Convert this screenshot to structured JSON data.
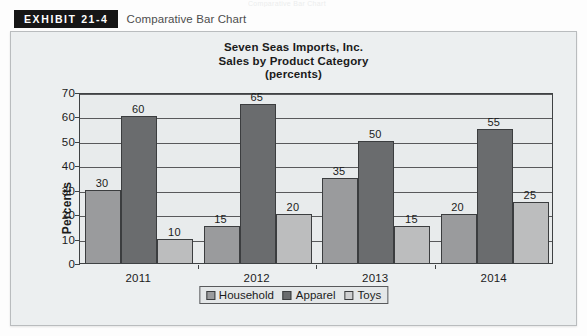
{
  "page": {
    "top_ghost_text": "Comparative Bar Chart"
  },
  "exhibit": {
    "badge": "EXHIBIT 21-4",
    "caption": "Comparative Bar Chart"
  },
  "chart_data": {
    "type": "bar",
    "title": "Seven Seas Imports, Inc.",
    "subtitle": "Sales by Product Category",
    "units_line": "(percents)",
    "title_lines": [
      "Seven Seas Imports, Inc.",
      "Sales by Product Category",
      "(percents)"
    ],
    "categories": [
      "2011",
      "2012",
      "2013",
      "2014"
    ],
    "series": [
      {
        "name": "Household",
        "color": "#9a9b9d",
        "values": [
          30,
          15,
          35,
          20
        ]
      },
      {
        "name": "Apparel",
        "color": "#6a6c6e",
        "values": [
          60,
          65,
          50,
          55
        ]
      },
      {
        "name": "Toys",
        "color": "#bcbdbe",
        "values": [
          10,
          20,
          15,
          25
        ]
      }
    ],
    "xlabel": "",
    "ylabel": "Percents",
    "ylim": [
      0,
      70
    ],
    "yticks": [
      0,
      10,
      20,
      30,
      40,
      50,
      60,
      70
    ],
    "grid": true,
    "data_labels": true,
    "legend_position": "bottom"
  }
}
